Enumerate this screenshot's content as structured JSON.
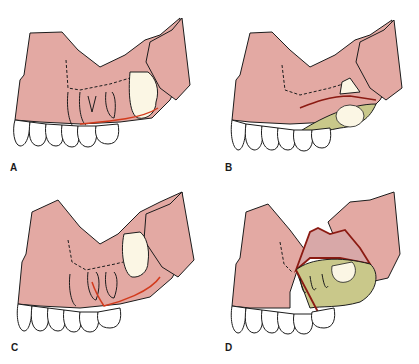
{
  "figure": {
    "colors": {
      "gingiva": "#e3a9a3",
      "outline": "#1c1c1c",
      "incision": "#d23a1c",
      "flap_edge": "#8b1a12",
      "bone": "#c9c88a",
      "tooth": "#fbf6e4",
      "background": "#ffffff"
    },
    "panels": [
      {
        "label": "A",
        "content": "Maxilla with impacted third molar; crestal incision line shown in red along gingival margin"
      },
      {
        "label": "B",
        "content": "Mucoperiosteal flap reflected exposing bone (green-stippled) over impacted molar"
      },
      {
        "label": "C",
        "content": "Alternative incision design with vertical release anterior, red incision line"
      },
      {
        "label": "D",
        "content": "Flap fully reflected superiorly with bone and molar crown exposed"
      }
    ]
  }
}
